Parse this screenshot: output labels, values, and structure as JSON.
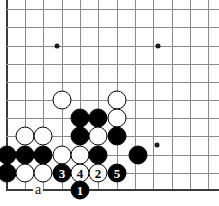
{
  "diagram": {
    "type": "go-board-diagram",
    "board": {
      "edges": {
        "left": true,
        "bottom": true,
        "top": false,
        "right": false
      },
      "grid": {
        "x_positions": [
          7,
          25,
          43,
          62,
          80,
          98,
          117,
          135,
          153,
          172,
          190,
          208
        ],
        "y_positions": [
          9,
          27,
          46,
          64,
          82,
          100,
          118,
          136,
          155,
          173,
          190
        ],
        "spacing": 18.4
      },
      "star_points": [
        {
          "x": 57,
          "y": 46
        },
        {
          "x": 158,
          "y": 46
        },
        {
          "x": 157,
          "y": 145
        }
      ]
    },
    "stones": [
      {
        "color": "white",
        "x": 62,
        "y": 100,
        "label": ""
      },
      {
        "color": "white",
        "x": 117,
        "y": 100,
        "label": ""
      },
      {
        "color": "black",
        "x": 80,
        "y": 118,
        "label": ""
      },
      {
        "color": "black",
        "x": 98,
        "y": 118,
        "label": ""
      },
      {
        "color": "white",
        "x": 117,
        "y": 118,
        "label": ""
      },
      {
        "color": "white",
        "x": 25,
        "y": 136,
        "label": ""
      },
      {
        "color": "white",
        "x": 43,
        "y": 136,
        "label": ""
      },
      {
        "color": "black",
        "x": 80,
        "y": 136,
        "label": ""
      },
      {
        "color": "white",
        "x": 98,
        "y": 136,
        "label": ""
      },
      {
        "color": "black",
        "x": 117,
        "y": 136,
        "label": ""
      },
      {
        "color": "black",
        "x": 7,
        "y": 155,
        "label": ""
      },
      {
        "color": "black",
        "x": 25,
        "y": 155,
        "label": ""
      },
      {
        "color": "black",
        "x": 43,
        "y": 155,
        "label": ""
      },
      {
        "color": "white",
        "x": 62,
        "y": 155,
        "label": ""
      },
      {
        "color": "white",
        "x": 80,
        "y": 155,
        "label": ""
      },
      {
        "color": "black",
        "x": 98,
        "y": 155,
        "label": ""
      },
      {
        "color": "black",
        "x": 138,
        "y": 155,
        "label": ""
      },
      {
        "color": "black",
        "x": 7,
        "y": 173,
        "label": ""
      },
      {
        "color": "white",
        "x": 25,
        "y": 173,
        "label": ""
      },
      {
        "color": "white",
        "x": 43,
        "y": 173,
        "label": ""
      },
      {
        "color": "black",
        "x": 62,
        "y": 173,
        "label": "3"
      },
      {
        "color": "white",
        "x": 80,
        "y": 173,
        "label": "4"
      },
      {
        "color": "white",
        "x": 98,
        "y": 173,
        "label": "2"
      },
      {
        "color": "black",
        "x": 117,
        "y": 173,
        "label": "5"
      },
      {
        "color": "black",
        "x": 80,
        "y": 190,
        "label": "1"
      }
    ],
    "point_labels": [
      {
        "text": "a",
        "x": 38,
        "y": 190
      }
    ],
    "colors": {
      "black_stone": "#000000",
      "white_stone": "#ffffff",
      "stone_outline": "#000000",
      "grid_line": "#8a8a8a",
      "board_edge": "#3a3a3a",
      "background": "#ffffff"
    }
  }
}
